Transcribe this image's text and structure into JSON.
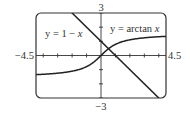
{
  "chart_data": {
    "type": "line",
    "title": "",
    "xlabel": "",
    "ylabel": "",
    "xlim": [
      -4.5,
      4.5
    ],
    "ylim": [
      -3,
      3
    ],
    "grid": false,
    "x_ticks_step": 1,
    "y_ticks_step": 1,
    "axis_labels": {
      "xmin": "−4.5",
      "xmax": "4.5",
      "ymin": "−3",
      "ymax": "3"
    },
    "series": [
      {
        "name": "y = 1 − x",
        "function": "1 - x",
        "x": [
          -2,
          -1,
          0,
          0.52,
          1,
          2,
          3,
          4
        ],
        "y": [
          3,
          2,
          1,
          0.48,
          0,
          -1,
          -2,
          -3
        ]
      },
      {
        "name": "y = arctan x",
        "function": "atan(x)",
        "x": [
          -4.5,
          -3,
          -2,
          -1,
          0,
          1,
          2,
          3,
          4.5
        ],
        "y": [
          -1.35,
          -1.25,
          -1.11,
          -0.79,
          0,
          0.79,
          1.11,
          1.25,
          1.35
        ]
      }
    ],
    "annotations": [
      {
        "text": "y = 1 − x",
        "position": "upper-left"
      },
      {
        "text": "y = arctan x",
        "position": "upper-right"
      }
    ]
  },
  "labels": {
    "xmin": "−4.5",
    "xmax": "4.5",
    "ymin": "−3",
    "ymax": "3",
    "line_eq_prefix": "y = 1 − ",
    "line_eq_var": "x",
    "atan_eq_prefix": "y = arctan ",
    "atan_eq_var": "x"
  },
  "colors": {
    "curve": "#222222",
    "axis": "#333333",
    "frame": "#333333"
  }
}
